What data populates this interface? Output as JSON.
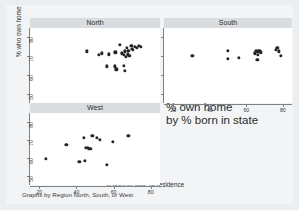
{
  "figure": {
    "ytitle": "% who own home",
    "xtitle": "% born in state of residence",
    "note": "Graphs by Region North, South, or West",
    "overlay_line1": "% own home",
    "overlay_line2": "by % born in state",
    "marker_color": "#252525",
    "header_color": "#d9dde0",
    "background_color": "#eceff1",
    "plot_background": "#ffffff",
    "axis_color": "#7b8184"
  },
  "chart_data": {
    "type": "scatter",
    "title": "% own home by % born in state",
    "xlabel": "% born in state of residence",
    "ylabel": "% who own home",
    "xlim": [
      15,
      85
    ],
    "ylim": [
      45,
      85
    ],
    "xticks": [
      20,
      40,
      60,
      80
    ],
    "yticks": [
      50,
      60,
      70,
      80
    ],
    "grid": false,
    "legend": "none",
    "panel_by": "Region North, South, or West",
    "note": "Graphs by Region North, South, or West",
    "series": [
      {
        "name": "North",
        "points": [
          [
            45.5,
            72.5
          ],
          [
            52.0,
            70.5
          ],
          [
            53.5,
            71.5
          ],
          [
            57.5,
            71.0
          ],
          [
            61.0,
            72.0
          ],
          [
            63.5,
            76.0
          ],
          [
            64.5,
            71.5
          ],
          [
            65.5,
            70.5
          ],
          [
            66.0,
            72.5
          ],
          [
            66.5,
            69.5
          ],
          [
            67.0,
            74.5
          ],
          [
            67.5,
            71.0
          ],
          [
            68.0,
            73.0
          ],
          [
            68.5,
            70.0
          ],
          [
            69.5,
            75.5
          ],
          [
            70.0,
            74.0
          ],
          [
            70.5,
            73.5
          ],
          [
            71.5,
            75.0
          ],
          [
            72.5,
            74.5
          ],
          [
            73.5,
            75.5
          ],
          [
            74.5,
            75.0
          ],
          [
            56.5,
            64.5
          ],
          [
            60.5,
            64.5
          ],
          [
            61.5,
            63.0
          ],
          [
            65.5,
            65.0
          ],
          [
            66.0,
            62.0
          ]
        ]
      },
      {
        "name": "South",
        "points": [
          [
            30.5,
            70.0
          ],
          [
            50.0,
            73.0
          ],
          [
            50.0,
            68.5
          ],
          [
            56.0,
            69.0
          ],
          [
            64.5,
            71.5
          ],
          [
            65.5,
            72.5
          ],
          [
            66.0,
            68.0
          ],
          [
            66.5,
            70.5
          ],
          [
            67.0,
            72.5
          ],
          [
            67.5,
            73.0
          ],
          [
            68.0,
            72.0
          ],
          [
            76.0,
            73.5
          ],
          [
            77.0,
            74.5
          ],
          [
            78.0,
            72.5
          ],
          [
            79.0,
            70.0
          ]
        ]
      },
      {
        "name": "West",
        "points": [
          [
            23.5,
            59.5
          ],
          [
            34.5,
            67.5
          ],
          [
            41.5,
            58.0
          ],
          [
            44.0,
            71.0
          ],
          [
            44.5,
            58.5
          ],
          [
            45.0,
            65.5
          ],
          [
            46.0,
            65.5
          ],
          [
            46.5,
            65.0
          ],
          [
            47.5,
            65.0
          ],
          [
            48.5,
            72.5
          ],
          [
            51.0,
            71.0
          ],
          [
            52.5,
            70.0
          ],
          [
            56.5,
            56.0
          ],
          [
            59.5,
            69.0
          ],
          [
            68.0,
            72.5
          ]
        ]
      }
    ]
  },
  "panels": [
    {
      "label": "North",
      "xticks": [
        20,
        40,
        60,
        80
      ],
      "yticks": [
        50,
        60,
        70,
        80
      ],
      "show_xlabels": false,
      "show_ylabels": true
    },
    {
      "label": "South",
      "xticks": [
        20,
        40,
        60,
        80
      ],
      "yticks": [
        50,
        60,
        70,
        80
      ],
      "show_xlabels": true,
      "show_ylabels": false
    },
    {
      "label": "West",
      "xticks": [
        20,
        40,
        60,
        80
      ],
      "yticks": [
        50,
        60,
        70,
        80
      ],
      "show_xlabels": true,
      "show_ylabels": true
    }
  ]
}
